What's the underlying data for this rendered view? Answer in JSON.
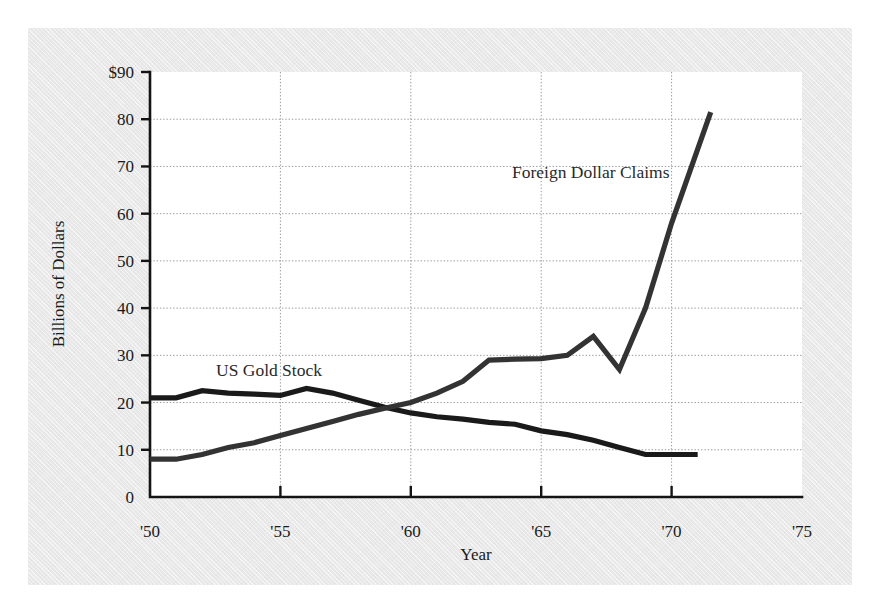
{
  "chart_data": {
    "type": "line",
    "title": "",
    "xlabel": "Year",
    "ylabel": "Billions of Dollars",
    "xlim": [
      1950,
      1975
    ],
    "ylim": [
      0,
      90
    ],
    "grid": true,
    "legend_position": "inline-annotations",
    "x_tick_labels": [
      "'50",
      "'55",
      "'60",
      "'65",
      "'70",
      "'75"
    ],
    "x_tick_values": [
      1950,
      1955,
      1960,
      1965,
      1970,
      1975
    ],
    "y_tick_labels": [
      "$90",
      "80",
      "70",
      "60",
      "50",
      "40",
      "30",
      "20",
      "10",
      "0"
    ],
    "y_tick_values": [
      90,
      80,
      70,
      60,
      50,
      40,
      30,
      20,
      10,
      0
    ],
    "series": [
      {
        "name": "US Gold Stock",
        "color": "#1a1a1a",
        "annotation_label": "US Gold Stock",
        "x": [
          1950,
          1951,
          1952,
          1953,
          1954,
          1955,
          1956,
          1957,
          1958,
          1959,
          1960,
          1961,
          1962,
          1963,
          1964,
          1965,
          1966,
          1967,
          1968,
          1969,
          1970,
          1971
        ],
        "values": [
          21,
          21,
          22.5,
          22,
          21.8,
          21.5,
          23,
          22,
          20.5,
          19,
          17.8,
          17,
          16.5,
          15.8,
          15.4,
          14,
          13.2,
          12,
          10.5,
          9,
          9,
          9
        ]
      },
      {
        "name": "Foreign Dollar Claims",
        "color": "#333333",
        "annotation_label": "Foreign Dollar Claims",
        "x": [
          1950,
          1951,
          1952,
          1953,
          1954,
          1955,
          1956,
          1957,
          1958,
          1959,
          1960,
          1961,
          1962,
          1963,
          1964,
          1965,
          1966,
          1967,
          1968,
          1969,
          1970,
          1971.5
        ],
        "values": [
          8,
          8,
          9,
          10.5,
          11.5,
          13,
          14.5,
          16,
          17.5,
          18.8,
          20,
          22,
          24.5,
          29,
          29.2,
          29.3,
          30,
          34,
          27,
          40,
          58,
          81.5
        ]
      }
    ]
  }
}
